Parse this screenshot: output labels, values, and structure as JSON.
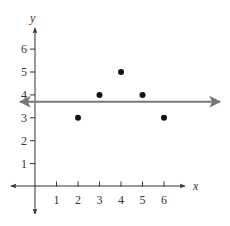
{
  "chart_data": {
    "type": "scatter",
    "title": "",
    "xlabel": "x",
    "ylabel": "y",
    "xlim": [
      -1,
      7
    ],
    "ylim": [
      -1,
      7
    ],
    "grid": false,
    "legend": null,
    "x_ticks": [
      1,
      2,
      3,
      4,
      5,
      6
    ],
    "y_ticks": [
      1,
      2,
      3,
      4,
      5,
      6
    ],
    "x_tick_labels": [
      "1",
      "2",
      "3",
      "4",
      "5",
      "6"
    ],
    "y_tick_labels": [
      "1",
      "2",
      "3",
      "4",
      "5",
      "6"
    ],
    "series": [
      {
        "name": "points",
        "type": "scatter",
        "x": [
          2,
          3,
          4,
          5,
          6
        ],
        "y": [
          3,
          4,
          5,
          4,
          3
        ],
        "color": "#111111"
      },
      {
        "name": "horizontal-line",
        "type": "line",
        "equation": "y = 3.7",
        "y": 3.7,
        "color": "#777777",
        "arrows": "both"
      }
    ]
  },
  "colors": {
    "axis": "#333333",
    "points": "#111111",
    "line": "#777777"
  }
}
